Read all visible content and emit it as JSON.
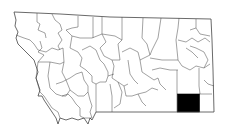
{
  "map": {
    "region": "Montana",
    "subdivision": "counties",
    "highlighted_county": "Powder River County",
    "highlight_color": "#000000",
    "base_fill": "#ffffff",
    "border_color": "#555555"
  }
}
